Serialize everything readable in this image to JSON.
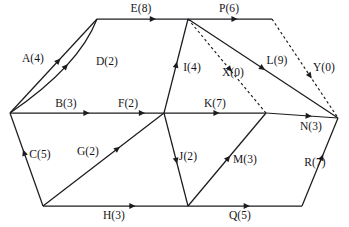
{
  "diagram": {
    "type": "directed-graph",
    "background_color": "#ffffff",
    "line_color": "#1c1c20",
    "vertices": [
      {
        "id": "v1",
        "name": "left-vertex",
        "x": 10,
        "y": 113
      },
      {
        "id": "v2",
        "name": "top-left-vertex",
        "x": 97,
        "y": 19
      },
      {
        "id": "v3",
        "name": "top-middle-vertex",
        "x": 188,
        "y": 19
      },
      {
        "id": "v4",
        "name": "top-right-vertex",
        "x": 272,
        "y": 19
      },
      {
        "id": "v5",
        "name": "center-vertex",
        "x": 164,
        "y": 113
      },
      {
        "id": "v6",
        "name": "right-center-vertex",
        "x": 266,
        "y": 113
      },
      {
        "id": "v7",
        "name": "far-right-vertex",
        "x": 338,
        "y": 118
      },
      {
        "id": "v8",
        "name": "bottom-left-vertex",
        "x": 43,
        "y": 206
      },
      {
        "id": "v9",
        "name": "bottom-middle-vertex",
        "x": 188,
        "y": 206
      },
      {
        "id": "v10",
        "name": "bottom-right-vertex",
        "x": 302,
        "y": 206
      }
    ],
    "edges": [
      {
        "id": "A",
        "label": "A(4)",
        "weight": 4,
        "from": "v1",
        "to": "v2",
        "style": "solid",
        "arrow_t": 0.56,
        "label_x": 33,
        "label_y": 59
      },
      {
        "id": "B",
        "label": "B(3)",
        "weight": 3,
        "from": "v1",
        "to": "v5",
        "style": "solid",
        "arrow_t": 0.5,
        "label_x": 66,
        "label_y": 104
      },
      {
        "id": "C",
        "label": "C(5)",
        "weight": 5,
        "from": "v8",
        "to": "v1",
        "style": "solid",
        "arrow_t": 0.58,
        "label_x": 40,
        "label_y": 155
      },
      {
        "id": "D",
        "label": "D(2)",
        "weight": 2,
        "from": "v1",
        "to": "v2",
        "style": "solid",
        "curve": "inner",
        "ctrl_x": 79,
        "ctrl_y": 66,
        "arrow_t": 0.5,
        "label_x": 107,
        "label_y": 62
      },
      {
        "id": "E",
        "label": "E(8)",
        "weight": 8,
        "from": "v2",
        "to": "v3",
        "style": "solid",
        "arrow_t": 0.62,
        "label_x": 141,
        "label_y": 9
      },
      {
        "id": "F",
        "label": "F(2)",
        "weight": 2,
        "from": "v1",
        "to": "v5",
        "style": "none",
        "arrow_t": 0.86,
        "label_x": 128,
        "label_y": 104
      },
      {
        "id": "G",
        "label": "G(2)",
        "weight": 2,
        "from": "v8",
        "to": "v5",
        "style": "solid",
        "arrow_t": 0.62,
        "label_x": 88,
        "label_y": 152
      },
      {
        "id": "H",
        "label": "H(3)",
        "weight": 3,
        "from": "v8",
        "to": "v9",
        "style": "solid",
        "arrow_t": 0.62,
        "label_x": 114,
        "label_y": 216
      },
      {
        "id": "I",
        "label": "I(4)",
        "weight": 4,
        "from": "v5",
        "to": "v3",
        "style": "solid",
        "arrow_t": 0.52,
        "label_x": 192,
        "label_y": 68
      },
      {
        "id": "J",
        "label": "J(2)",
        "weight": 2,
        "from": "v5",
        "to": "v9",
        "style": "solid",
        "arrow_t": 0.52,
        "label_x": 188,
        "label_y": 157
      },
      {
        "id": "K",
        "label": "K(7)",
        "weight": 7,
        "from": "v5",
        "to": "v6",
        "style": "solid",
        "arrow_t": 0.52,
        "label_x": 215,
        "label_y": 104
      },
      {
        "id": "L",
        "label": "L(9)",
        "weight": 9,
        "from": "v3",
        "to": "v7",
        "style": "solid",
        "arrow_t": 0.5,
        "label_x": 277,
        "label_y": 61
      },
      {
        "id": "M",
        "label": "M(3)",
        "weight": 3,
        "from": "v9",
        "to": "v6",
        "style": "solid",
        "arrow_t": 0.52,
        "label_x": 245,
        "label_y": 160
      },
      {
        "id": "N",
        "label": "N(3)",
        "weight": 3,
        "from": "v6",
        "to": "v7",
        "style": "solid",
        "arrow_t": 0.6,
        "label_x": 311,
        "label_y": 127
      },
      {
        "id": "P",
        "label": "P(6)",
        "weight": 6,
        "from": "v3",
        "to": "v4",
        "style": "solid",
        "arrow_t": 0.56,
        "label_x": 229,
        "label_y": 9
      },
      {
        "id": "Q",
        "label": "Q(5)",
        "weight": 5,
        "from": "v9",
        "to": "v10",
        "style": "solid",
        "arrow_t": 0.52,
        "label_x": 240,
        "label_y": 216
      },
      {
        "id": "R",
        "label": "R(7)",
        "weight": 7,
        "from": "v10",
        "to": "v7",
        "style": "solid",
        "arrow_t": 0.56,
        "label_x": 315,
        "label_y": 163
      },
      {
        "id": "X",
        "label": "X(0)",
        "weight": 0,
        "from": "v3",
        "to": "v6",
        "style": "dashed",
        "arrow_t": 0.54,
        "label_x": 233,
        "label_y": 73
      },
      {
        "id": "Y",
        "label": "Y(0)",
        "weight": 0,
        "from": "v4",
        "to": "v7",
        "style": "dashed",
        "arrow_t": 0.58,
        "label_x": 324,
        "label_y": 68
      }
    ]
  }
}
